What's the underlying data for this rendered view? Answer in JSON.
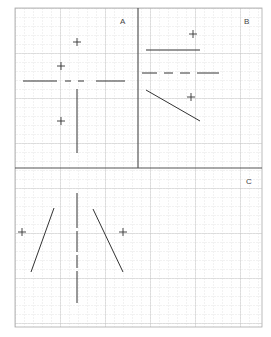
{
  "panels": [
    {
      "label": "A"
    },
    {
      "label": "B"
    },
    {
      "label": "C"
    }
  ],
  "colors": {
    "grid_minor": "#d6d6d6",
    "grid_major": "#bdbdbd",
    "divider": "#555555",
    "stroke": "#333333"
  }
}
